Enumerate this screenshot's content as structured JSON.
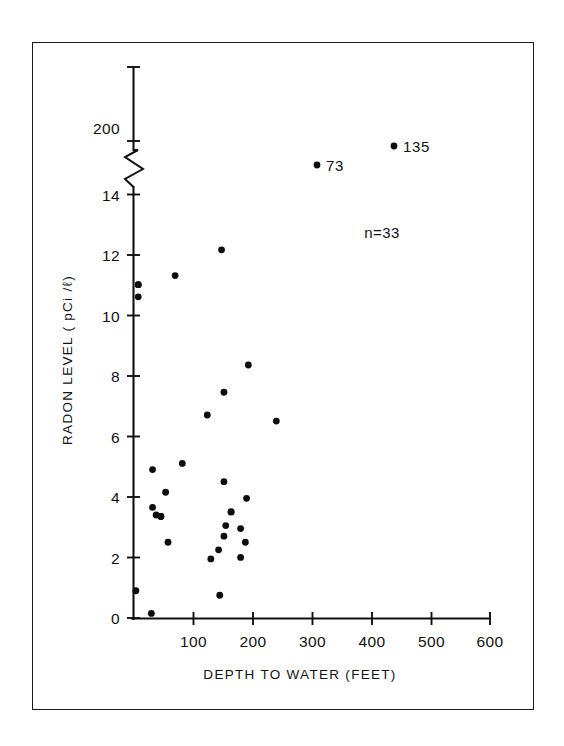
{
  "figure": {
    "background_color": "#ffffff",
    "ink_color": "#111111",
    "border": true
  },
  "chart_data": {
    "type": "scatter",
    "title": "",
    "xlabel": "DEPTH TO WATER (FEET)",
    "ylabel": "RADON LEVEL ( pCi /ℓ)",
    "xlim": [
      0,
      600
    ],
    "ylim": [
      0,
      14
    ],
    "grid": false,
    "legend": null,
    "xticks": [
      100,
      200,
      300,
      400,
      500,
      600
    ],
    "xticklabels": [
      "100",
      "200",
      "300",
      "400",
      "500",
      "600"
    ],
    "yticks": [
      0,
      2,
      4,
      6,
      8,
      10,
      12,
      14
    ],
    "yticklabels": [
      "0",
      "2",
      "4",
      "6",
      "8",
      "10",
      "12",
      "14"
    ],
    "y_axis_break": {
      "present": true,
      "below": 14,
      "above_label": "200",
      "above_value": 200
    },
    "annotations": [
      {
        "text": "n=33",
        "x": 350,
        "y": 11.0
      }
    ],
    "point_labels": [
      {
        "text": "73",
        "x": 308,
        "y": 200,
        "offscale": true
      },
      {
        "text": "135",
        "x": 438,
        "y": 200,
        "offscale": true
      }
    ],
    "points": [
      {
        "x": 8,
        "y": 11.0
      },
      {
        "x": 8,
        "y": 10.6
      },
      {
        "x": 70,
        "y": 11.3
      },
      {
        "x": 148,
        "y": 12.15
      },
      {
        "x": 193,
        "y": 8.35
      },
      {
        "x": 152,
        "y": 7.45
      },
      {
        "x": 124,
        "y": 6.7
      },
      {
        "x": 240,
        "y": 6.5
      },
      {
        "x": 32,
        "y": 4.9
      },
      {
        "x": 82,
        "y": 5.1
      },
      {
        "x": 152,
        "y": 4.5
      },
      {
        "x": 54,
        "y": 4.15
      },
      {
        "x": 190,
        "y": 3.95
      },
      {
        "x": 32,
        "y": 3.65
      },
      {
        "x": 38,
        "y": 3.4
      },
      {
        "x": 46,
        "y": 3.35
      },
      {
        "x": 164,
        "y": 3.5
      },
      {
        "x": 155,
        "y": 3.05
      },
      {
        "x": 180,
        "y": 2.95
      },
      {
        "x": 152,
        "y": 2.7
      },
      {
        "x": 188,
        "y": 2.5
      },
      {
        "x": 58,
        "y": 2.5
      },
      {
        "x": 143,
        "y": 2.25
      },
      {
        "x": 130,
        "y": 1.95
      },
      {
        "x": 180,
        "y": 2.0
      },
      {
        "x": 4,
        "y": 0.9
      },
      {
        "x": 145,
        "y": 0.75
      },
      {
        "x": 30,
        "y": 0.15
      },
      {
        "x": 308,
        "y": 200
      },
      {
        "x": 438,
        "y": 200
      },
      {
        "x": 8,
        "y": 11.0
      },
      {
        "x": 46,
        "y": 3.35
      },
      {
        "x": 164,
        "y": 3.5
      }
    ],
    "n": 33,
    "n_label": "n=33"
  }
}
